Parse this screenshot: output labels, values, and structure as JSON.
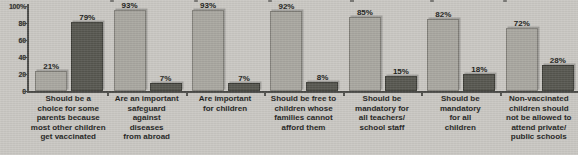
{
  "chart_data": {
    "type": "bar",
    "title": "",
    "subtitle": "",
    "xlabel": "",
    "ylabel": "",
    "ylim": [
      0,
      100
    ],
    "ytick_labels": [
      "100%",
      "80",
      "60",
      "40",
      "20",
      "0"
    ],
    "ytick_values": [
      100,
      80,
      60,
      40,
      20,
      0
    ],
    "grid": false,
    "legend": null,
    "categories": [
      "Should be a choice for some parents because most other children get vaccinated",
      "Are an important safeguard against diseases from abroad",
      "Are important for children",
      "Should be free to children whose families cannot afford them",
      "Should be mandatory for all teachers/ school staff",
      "Should be mandatory for all children",
      "Non-vaccinated children should not be allowed to attend private/ public schools"
    ],
    "category_lines": [
      [
        "Should be a",
        "choice for some",
        "parents because",
        "most other children",
        "get vaccinated"
      ],
      [
        "Are an important",
        "safeguard",
        "against",
        "diseases",
        "from abroad"
      ],
      [
        "Are important",
        "for children"
      ],
      [
        "Should be free to",
        "children whose",
        "families cannot",
        "afford them"
      ],
      [
        "Should be",
        "mandatory for",
        "all teachers/",
        "school staff"
      ],
      [
        "Should be",
        "mandatory",
        "for all",
        "children"
      ],
      [
        "Non-vaccinated",
        "children should",
        "not be allowed to",
        "attend private/",
        "public schools"
      ]
    ],
    "series": [
      {
        "name": "light",
        "color": "#a8a69f",
        "values": [
          21,
          93,
          93,
          92,
          85,
          82,
          72
        ],
        "labels": [
          "21%",
          "93%",
          "93%",
          "92%",
          "85%",
          "82%",
          "72%"
        ]
      },
      {
        "name": "dark",
        "color": "#56564f",
        "values": [
          79,
          7,
          7,
          8,
          15,
          18,
          28
        ],
        "labels": [
          "79%",
          "7%",
          "7%",
          "8%",
          "15%",
          "18%",
          "28%"
        ]
      }
    ]
  },
  "colors": {
    "background": "#c9c7c2",
    "axis": "#4a4a47",
    "light_bar": "#a8a69f",
    "dark_bar": "#56564f",
    "text": "#1f1f1e"
  }
}
